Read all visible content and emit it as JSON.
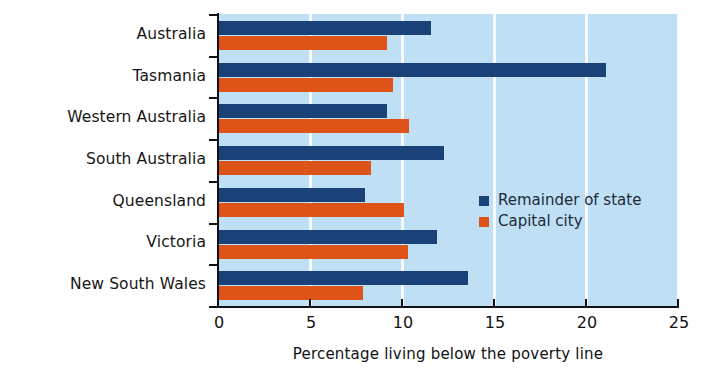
{
  "chart_data": {
    "type": "bar",
    "orientation": "horizontal",
    "title": "",
    "xlabel": "Percentage living below the poverty line",
    "ylabel": "State",
    "xlim": [
      0,
      25
    ],
    "xticks": [
      "0",
      "5",
      "10",
      "15",
      "20",
      "25"
    ],
    "xtick_values": [
      0,
      5,
      10,
      15,
      20,
      25
    ],
    "grid": "vertical-white-gridlines",
    "legend_position": "inside-right-middle",
    "categories": [
      "New South Wales",
      "Victoria",
      "Queensland",
      "South Australia",
      "Western Australia",
      "Tasmania",
      "Australia"
    ],
    "series": [
      {
        "name": "Remainder of state",
        "color": "#1b4179",
        "values": [
          13.6,
          11.9,
          8.0,
          12.3,
          9.2,
          21.1,
          11.6
        ]
      },
      {
        "name": "Capital city",
        "color": "#dd5318",
        "values": [
          7.9,
          10.3,
          10.1,
          8.3,
          10.4,
          9.5,
          9.2
        ]
      }
    ],
    "colors": {
      "plot_background": "#bfdff4",
      "gridline": "#ffffff",
      "axis": "#111111",
      "page_background": "#ffffff"
    }
  },
  "legend": {
    "items": [
      {
        "label": "Remainder of state",
        "swatch": "remainder"
      },
      {
        "label": "Capital city",
        "swatch": "capital"
      }
    ]
  }
}
